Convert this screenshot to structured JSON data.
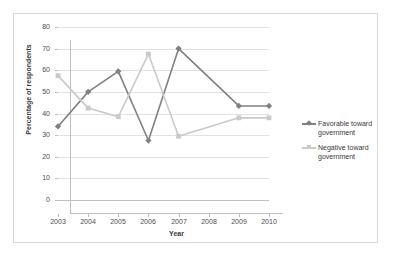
{
  "chart_data": {
    "type": "line",
    "title": "",
    "xlabel": "Year",
    "ylabel": "Percentage of respondents",
    "categories": [
      "2003",
      "2004",
      "2005",
      "2006",
      "2007",
      "2008",
      "2009",
      "2010"
    ],
    "x": [
      2003,
      2004,
      2005,
      2006,
      2007,
      2008,
      2009,
      2010
    ],
    "xlim": [
      2003,
      2010
    ],
    "ylim": [
      0,
      80
    ],
    "yticks": [
      0,
      10,
      20,
      30,
      40,
      50,
      60,
      70,
      80
    ],
    "ytick_labels": [
      "0",
      "10",
      "20",
      "30",
      "40",
      "50",
      "60",
      "70",
      "80"
    ],
    "grid": "horizontal",
    "legend_position": "right",
    "series": [
      {
        "name": "Favorable toward government",
        "color": "#808080",
        "marker": "diamond",
        "x": [
          2003,
          2004,
          2005,
          2006,
          2007,
          2009,
          2010
        ],
        "values": [
          34,
          50,
          59.5,
          27.5,
          70,
          43.5,
          43.5
        ]
      },
      {
        "name": "Negative toward government",
        "color": "#c9c9c9",
        "marker": "square",
        "x": [
          2003,
          2004,
          2005,
          2006,
          2007,
          2009,
          2010
        ],
        "values": [
          57.5,
          42.5,
          38.5,
          67.5,
          29.5,
          38,
          38
        ]
      }
    ]
  },
  "axes": {
    "y_title": "Percentage of respondents",
    "x_title": "Year",
    "y_labels": [
      "80",
      "70",
      "60",
      "50",
      "40",
      "30",
      "20",
      "10",
      "0"
    ],
    "x_labels": [
      "2003",
      "2004",
      "2005",
      "2006",
      "2007",
      "2008",
      "2009",
      "2010"
    ]
  },
  "legend": {
    "items": [
      {
        "label_line1": "Favorable toward",
        "label_line2": "government",
        "color": "#808080",
        "marker": "diamond"
      },
      {
        "label_line1": "Negative toward",
        "label_line2": "government",
        "color": "#c9c9c9",
        "marker": "square"
      }
    ]
  },
  "colors": {
    "favorable": "#808080",
    "negative": "#c9c9c9",
    "grid": "#e2e2e2",
    "axis": "#bfbfbf",
    "frame": "#d8d8d8",
    "text": "#4d4d4d",
    "background": "#ffffff"
  }
}
